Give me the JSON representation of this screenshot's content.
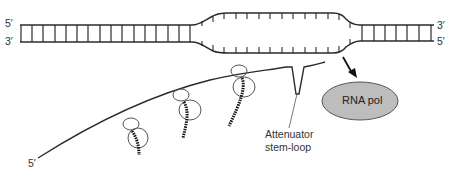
{
  "diagram": {
    "dna": {
      "left_top_label": "5′",
      "left_bottom_label": "3′",
      "right_top_label": "3′",
      "right_bottom_label": "5′",
      "state": "transcription bubble (open DNA) at polymerase"
    },
    "mrna": {
      "end_label": "5′",
      "ribosome_count": 3,
      "nascent_peptides": 3
    },
    "stem_loop": {
      "label_line1": "Attenuator",
      "label_line2": "stem-loop"
    },
    "polymerase": {
      "label": "RNA pol",
      "fill_color": "#bdbdbd"
    },
    "colors": {
      "line": "#2b2b2b",
      "text": "#333333",
      "background": "#ffffff"
    }
  }
}
